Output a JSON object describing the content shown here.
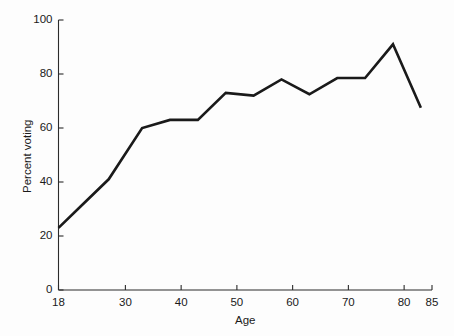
{
  "chart_data": {
    "type": "line",
    "title": "",
    "subtitle": "",
    "xlabel": "Age",
    "ylabel": "Percent voting",
    "xlim": [
      18,
      85
    ],
    "ylim": [
      0,
      100
    ],
    "grid": false,
    "legend": null,
    "legend_position": "none",
    "line_color": "#1a1a1a",
    "background_color": "#fdfdfd",
    "axis_color": "#2b2b2b",
    "xticks": [
      18,
      30,
      40,
      50,
      60,
      70,
      80,
      85
    ],
    "xtick_labels": [
      "18",
      "30",
      "40",
      "50",
      "60",
      "70",
      "80",
      "85"
    ],
    "yticks": [
      0,
      20,
      40,
      60,
      80,
      100
    ],
    "ytick_labels": [
      "0",
      "20",
      "40",
      "60",
      "80",
      "100"
    ],
    "x": [
      18,
      22,
      27,
      33,
      38,
      43,
      48,
      53,
      58,
      63,
      68,
      73,
      78,
      83
    ],
    "values": [
      23,
      31,
      41,
      60,
      63,
      63,
      73,
      72,
      78,
      72.5,
      78.5,
      78.5,
      91,
      67.5
    ],
    "series": [
      {
        "name": "Percent voting",
        "x": [
          18,
          22,
          27,
          33,
          38,
          43,
          48,
          53,
          58,
          63,
          68,
          73,
          78,
          83
        ],
        "values": [
          23,
          31,
          41,
          60,
          63,
          63,
          73,
          72,
          78,
          72.5,
          78.5,
          78.5,
          91,
          67.5
        ]
      }
    ],
    "annotations": []
  }
}
